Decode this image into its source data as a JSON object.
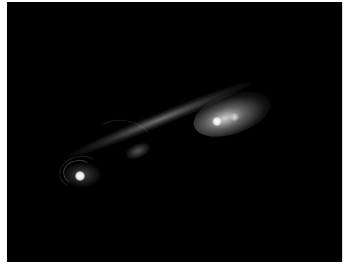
{
  "image": {
    "description": "Astronomical grayscale image of a bright compact core emitting a diffuse jet toward the upper right, ending in a bright lobe",
    "background_color": "#000000",
    "frame_color": "#ffffff",
    "features": [
      {
        "name": "core",
        "brightness": "brightest"
      },
      {
        "name": "jet",
        "brightness": "moderate"
      },
      {
        "name": "lobe",
        "brightness": "bright"
      }
    ]
  }
}
